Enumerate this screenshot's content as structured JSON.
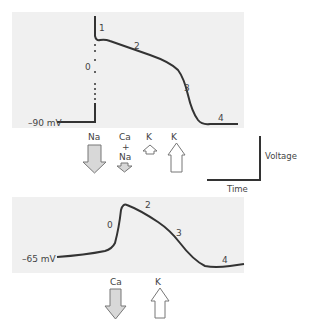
{
  "colors": {
    "panel_bg": "#f0f0f0",
    "curve": "#333333",
    "arrow_inward_fill": "#d8d8d8",
    "arrow_outward_fill": "#ffffff",
    "arrow_stroke": "#777777"
  },
  "top_panel": {
    "baseline_label": "–90 mV",
    "phases": [
      "0",
      "1",
      "2",
      "3",
      "4"
    ],
    "ions": [
      {
        "label": "Na",
        "direction": "down",
        "size": "large",
        "fill": "inward"
      },
      {
        "label_top": "Ca",
        "label_mid": "+",
        "label_bottom": "Na",
        "direction": "down",
        "size": "small",
        "fill": "inward"
      },
      {
        "label": "K",
        "direction": "up",
        "size": "small",
        "fill": "outward"
      },
      {
        "label": "K",
        "direction": "up",
        "size": "large",
        "fill": "outward"
      }
    ]
  },
  "axes_legend": {
    "y_label": "Voltage",
    "x_label": "Time"
  },
  "bottom_panel": {
    "baseline_label": "–65 mV",
    "phases": [
      "0",
      "2",
      "3",
      "4"
    ],
    "ions": [
      {
        "label": "Ca",
        "direction": "down",
        "size": "large",
        "fill": "inward"
      },
      {
        "label": "K",
        "direction": "up",
        "size": "large",
        "fill": "outward"
      }
    ]
  }
}
